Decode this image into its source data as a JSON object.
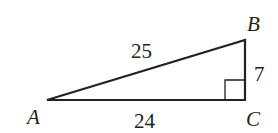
{
  "diagram": {
    "type": "right-triangle",
    "stroke_color": "#222222",
    "vertices": {
      "A": {
        "label": "A",
        "x": 47,
        "y": 100
      },
      "B": {
        "label": "B",
        "x": 245,
        "y": 40
      },
      "C": {
        "label": "C",
        "x": 245,
        "y": 100
      }
    },
    "sides": {
      "AB": {
        "label": "25"
      },
      "AC": {
        "label": "24"
      },
      "BC": {
        "label": "7"
      }
    },
    "right_angle_at": "C"
  }
}
